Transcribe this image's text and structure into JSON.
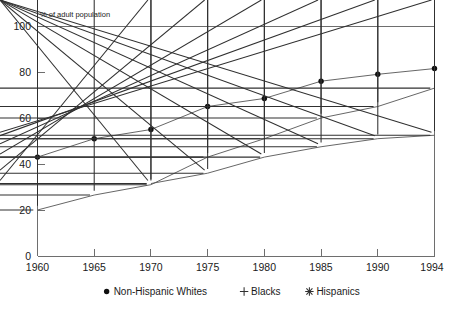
{
  "chart_data": {
    "type": "line",
    "title": "",
    "subtitle": "",
    "ylabel": "% of adult population",
    "xlabel": "",
    "x": [
      1960,
      1965,
      1970,
      1975,
      1980,
      1985,
      1990,
      1994
    ],
    "xtick_labels": [
      "1960",
      "1965",
      "1970",
      "1975",
      "1980",
      "1985",
      "1990",
      "1994"
    ],
    "ytick_labels": [
      "0",
      "20",
      "40",
      "60",
      "80",
      "100"
    ],
    "yticks": [
      0,
      20,
      40,
      60,
      80,
      100
    ],
    "ylim": [
      0,
      100
    ],
    "xlim": [
      1960,
      1994
    ],
    "grid": false,
    "legend_position": "bottom",
    "series": [
      {
        "name": "Non-Hispanic Whites",
        "marker": "dot",
        "x": [
          1960,
          1965,
          1970,
          1975,
          1980,
          1985,
          1990,
          1994
        ],
        "values": [
          43,
          51,
          55,
          65,
          68.5,
          76,
          79,
          81.5
        ]
      },
      {
        "name": "Blacks",
        "marker": "plus",
        "x": [
          1960,
          1965,
          1970,
          1975,
          1980,
          1985,
          1990,
          1994
        ],
        "values": [
          20,
          26.5,
          31,
          43,
          51,
          60,
          65,
          73
        ]
      },
      {
        "name": "Hispanics",
        "marker": "star",
        "x": [
          1970,
          1975,
          1980,
          1985,
          1990,
          1994
        ],
        "values": [
          31.5,
          36,
          43,
          47.5,
          51,
          52.5
        ]
      }
    ]
  },
  "axis": {
    "ylabel": "% of adult population",
    "ytick_0": "0",
    "ytick_1": "20",
    "ytick_2": "40",
    "ytick_3": "60",
    "ytick_4": "80",
    "ytick_5": "100",
    "xtick_0": "1960",
    "xtick_1": "1965",
    "xtick_2": "1970",
    "xtick_3": "1975",
    "xtick_4": "1980",
    "xtick_5": "1985",
    "xtick_6": "1990",
    "xtick_7": "1994"
  },
  "legend": {
    "items": [
      {
        "label": "Non-Hispanic Whites",
        "marker": "dot"
      },
      {
        "label": "Blacks",
        "marker": "plus"
      },
      {
        "label": "Hispanics",
        "marker": "star"
      }
    ]
  },
  "colors": {
    "axis": "#6e6e6e",
    "line": "#555555",
    "marker": "#101010",
    "text": "#1a1a1a",
    "background": "#ffffff"
  }
}
